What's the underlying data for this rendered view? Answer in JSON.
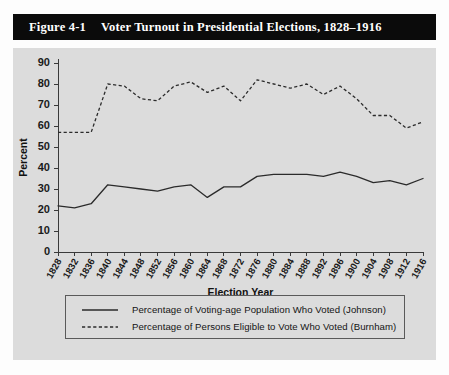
{
  "figure": {
    "number": "Figure 4-1",
    "title": "Voter Turnout in Presidential Elections, 1828–1916"
  },
  "chart_data": {
    "type": "line",
    "title": "Voter Turnout in Presidential Elections, 1828–1916",
    "xlabel": "Election Year",
    "ylabel": "Percent",
    "ylim": [
      0,
      90
    ],
    "ytick_step": 10,
    "yticks": [
      0,
      10,
      20,
      30,
      40,
      50,
      60,
      70,
      80,
      90
    ],
    "grid": false,
    "legend_position": "below-axes",
    "categories": [
      "1828",
      "1832",
      "1836",
      "1840",
      "1844",
      "1848",
      "1852",
      "1856",
      "1860",
      "1864",
      "1868",
      "1872",
      "1876",
      "1880",
      "1884",
      "1888",
      "1892",
      "1896",
      "1900",
      "1904",
      "1908",
      "1912",
      "1916"
    ],
    "series": [
      {
        "name": "Percentage of Voting-age Population Who Voted (Johnson)",
        "style": "solid",
        "values": [
          22,
          21,
          23,
          32,
          31,
          30,
          29,
          31,
          32,
          26,
          31,
          31,
          36,
          37,
          37,
          37,
          36,
          38,
          36,
          33,
          34,
          32,
          35
        ]
      },
      {
        "name": "Percentage of Persons Eligible to Vote Who Voted (Burnham)",
        "style": "dashed",
        "values": [
          57,
          57,
          57,
          80,
          79,
          73,
          72,
          79,
          81,
          76,
          79,
          72,
          82,
          80,
          78,
          80,
          75,
          79,
          73,
          65,
          65,
          59,
          62
        ]
      }
    ]
  },
  "legend": {
    "entries": [
      {
        "label": "Percentage of Voting-age Population Who Voted (Johnson)",
        "style": "solid"
      },
      {
        "label": "Percentage of Persons Eligible to Vote Who Voted (Burnham)",
        "style": "dashed"
      }
    ]
  },
  "colors": {
    "title_bar_background": "#0b0b0b",
    "title_bar_text": "#ffffff",
    "panel_background": "#dcdcdc",
    "line": "#2b2b2b",
    "axis": "#3a3a3a",
    "page_background": "#fdfdfd"
  }
}
